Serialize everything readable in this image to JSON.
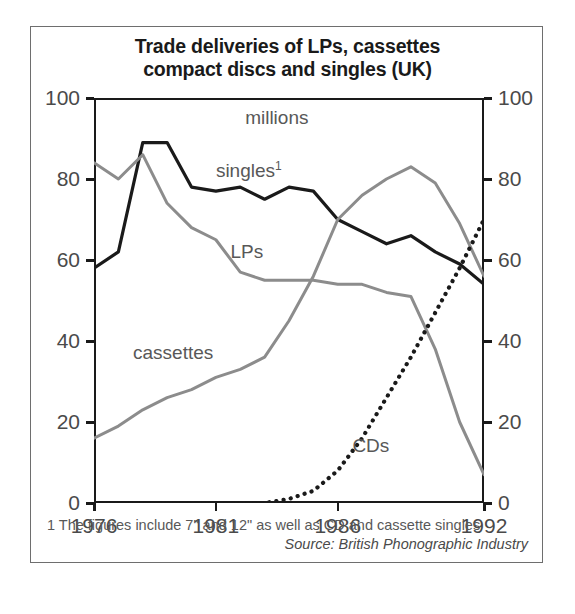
{
  "chart_data": {
    "type": "line",
    "title": "Trade deliveries of LPs, cassettes compact discs and singles (UK)",
    "title_line1": "Trade deliveries of LPs, cassettes",
    "title_line2": "compact discs and singles (UK)",
    "units_label": "millions",
    "xlabel": "",
    "ylabel": "millions",
    "xlim": [
      1976,
      1992
    ],
    "ylim": [
      0,
      100
    ],
    "x_ticks": [
      1976,
      1981,
      1986,
      1992
    ],
    "x_tick_labels": [
      "1976",
      "1981",
      "1986",
      "1992"
    ],
    "y_ticks": [
      0,
      20,
      40,
      60,
      80,
      100
    ],
    "y_tick_labels": [
      "0",
      "20",
      "40",
      "60",
      "80",
      "100"
    ],
    "right_axis": true,
    "right_y_tick_labels": [
      "0",
      "20",
      "40",
      "60",
      "80",
      "100"
    ],
    "grid": false,
    "legend_position": "inline-annotations",
    "x": [
      1976,
      1977,
      1978,
      1979,
      1980,
      1981,
      1982,
      1983,
      1984,
      1985,
      1986,
      1987,
      1988,
      1989,
      1990,
      1991,
      1992
    ],
    "series": [
      {
        "name": "singles",
        "label": "singles",
        "footnote_marker": "1",
        "style": "solid",
        "color": "#1a1a1a",
        "width": 3.2,
        "values": [
          58,
          62,
          89,
          89,
          78,
          77,
          78,
          75,
          78,
          77,
          70,
          67,
          64,
          66,
          62,
          59,
          54
        ]
      },
      {
        "name": "LPs",
        "label": "LPs",
        "style": "solid",
        "color": "#8c8c8c",
        "width": 3.0,
        "values": [
          84,
          80,
          86,
          74,
          68,
          65,
          57,
          55,
          55,
          55,
          54,
          54,
          52,
          51,
          38,
          20,
          7
        ]
      },
      {
        "name": "cassettes",
        "label": "cassettes",
        "style": "solid",
        "color": "#8c8c8c",
        "width": 3.0,
        "values": [
          16,
          19,
          23,
          26,
          28,
          31,
          33,
          36,
          45,
          56,
          70,
          76,
          80,
          83,
          79,
          69,
          56
        ]
      },
      {
        "name": "CDs",
        "label": "CDs",
        "style": "dotted",
        "color": "#1a1a1a",
        "width": 4.2,
        "values": [
          0,
          0,
          0,
          0,
          0,
          0,
          0,
          0,
          1,
          3,
          8,
          16,
          26,
          36,
          47,
          58,
          70
        ]
      }
    ],
    "annotations": [
      {
        "text": "millions",
        "x": 1982.2,
        "y": 95
      },
      {
        "text": "singles",
        "x": 1981.0,
        "y": 83,
        "sup": "1"
      },
      {
        "text": "LPs",
        "x": 1981.6,
        "y": 62
      },
      {
        "text": "cassettes",
        "x": 1977.6,
        "y": 37
      },
      {
        "text": "CDs",
        "x": 1986.6,
        "y": 14
      }
    ],
    "footnote": "1 The figures include 7\" and 12\" as well as CD and cassette singles",
    "source": "Source: British Phonographic Industry"
  }
}
